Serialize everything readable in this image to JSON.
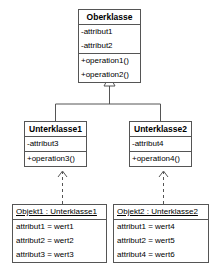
{
  "diagram": {
    "kind": "uml-class-diagram",
    "language": "de",
    "colors": {
      "background": "#ffffff",
      "line": "#555555",
      "text": "#000000",
      "fill": "#ffffff"
    },
    "superclass": {
      "name": "Oberklasse",
      "attributes": [
        "-attribut1",
        "-attribut2"
      ],
      "operations": [
        "+operation1()",
        "+operation2()"
      ]
    },
    "subclasses": [
      {
        "name": "Unterklasse1",
        "attributes": [
          "-attribut3"
        ],
        "operations": [
          "+operation3()"
        ]
      },
      {
        "name": "Unterklasse2",
        "attributes": [
          "-attribut4"
        ],
        "operations": [
          "+operation4()"
        ]
      }
    ],
    "objects": [
      {
        "title": "Objekt1 : Unterklasse1",
        "slots": [
          "attribut1 = wert1",
          "attribut2 = wert2",
          "attribut3 = wert3"
        ]
      },
      {
        "title": "Objekt2 : Unterklasse2",
        "slots": [
          "attribut1 = wert4",
          "attribut2 = wert5",
          "attribut4 = wert6"
        ]
      }
    ],
    "relations": {
      "generalization": {
        "type": "generalization",
        "arrowhead": "hollow-triangle",
        "line": "solid",
        "from": [
          "Unterklasse1",
          "Unterklasse2"
        ],
        "to": "Oberklasse"
      },
      "instantiation": {
        "type": "instance-of",
        "arrowhead": "open-arrow",
        "line": "dashed",
        "pairs": [
          {
            "from": "Objekt1 : Unterklasse1",
            "to": "Unterklasse1"
          },
          {
            "from": "Objekt2 : Unterklasse2",
            "to": "Unterklasse2"
          }
        ]
      }
    }
  }
}
